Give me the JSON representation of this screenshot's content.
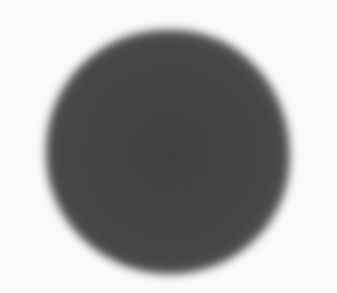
{
  "image": {
    "description": "Blurry dark gray sphere-like blob on a near-white background",
    "colors": {
      "background": "#fafafa",
      "blob_center": "#404040",
      "blob_edge": "#8a8a8a"
    }
  }
}
